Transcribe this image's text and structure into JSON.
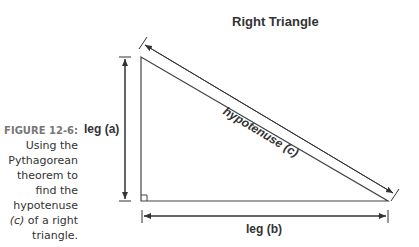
{
  "diagram": {
    "title": "Right Triangle",
    "labels": {
      "leg_a": "leg (a)",
      "leg_b": "leg (b)",
      "hypotenuse": "hypotenuse (c)"
    },
    "vertices": {
      "top": [
        141,
        57
      ],
      "right_angle": [
        141,
        201
      ],
      "bottom_right": [
        388,
        201
      ]
    }
  },
  "caption": {
    "figure": "FIGURE 12-6:",
    "line1": "Using the",
    "line2": "Pythagorean",
    "line3": "theorem to",
    "line4": "find the",
    "line5": "hypotenuse",
    "line6_var": "(c)",
    "line6_rest": " of a right",
    "line7": "triangle."
  }
}
